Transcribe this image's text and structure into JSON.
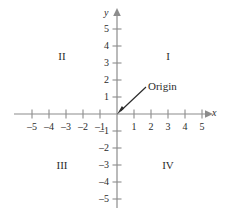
{
  "figure": {
    "type": "cartesian-coordinate-plane",
    "background_color": "#ffffff",
    "axis_color": "#8c8c8c",
    "text_color": "#2b2b2b",
    "annotation_arrow_color": "#2b2b2b"
  },
  "axes": {
    "x": {
      "label": "x",
      "min": -5,
      "max": 5,
      "tick_labels": [
        "–5",
        "–4",
        "–3",
        "–2",
        "–1",
        "1",
        "2",
        "3",
        "4",
        "5"
      ],
      "tick_values": [
        -5,
        -4,
        -3,
        -2,
        -1,
        1,
        2,
        3,
        4,
        5
      ],
      "has_arrow": true,
      "arrow_direction": "right"
    },
    "y": {
      "label": "y",
      "min": -5,
      "max": 5,
      "tick_labels": [
        "5",
        "4",
        "3",
        "2",
        "1",
        "–1",
        "–2",
        "–3",
        "–4",
        "–5"
      ],
      "tick_values": [
        5,
        4,
        3,
        2,
        1,
        -1,
        -2,
        -3,
        -4,
        -5
      ],
      "has_arrow": true,
      "arrow_direction": "up"
    }
  },
  "quadrants": [
    {
      "id": "quadrant-1",
      "label": "I",
      "x": 3,
      "y": 3
    },
    {
      "id": "quadrant-2",
      "label": "II",
      "x": -3.3,
      "y": 3
    },
    {
      "id": "quadrant-3",
      "label": "III",
      "x": -3.3,
      "y": -3
    },
    {
      "id": "quadrant-4",
      "label": "IV",
      "x": 3,
      "y": -3
    }
  ],
  "annotation": {
    "label": "Origin",
    "points_to": "origin",
    "target_point": {
      "x": 0,
      "y": 0
    },
    "text_anchor": {
      "x": 1.7,
      "y": 1.55
    }
  }
}
